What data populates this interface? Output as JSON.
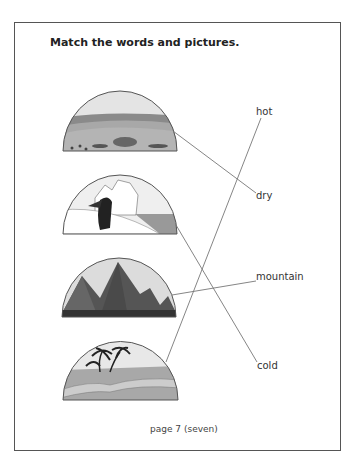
{
  "title": "Match the words and pictures.",
  "pictures": [
    {
      "name": "savanna-plain"
    },
    {
      "name": "penguin-iceberg"
    },
    {
      "name": "mountains"
    },
    {
      "name": "oasis-palm-trees"
    }
  ],
  "words": [
    {
      "label": "hot"
    },
    {
      "label": "dry"
    },
    {
      "label": "mountain"
    },
    {
      "label": "cold"
    }
  ],
  "footer": "page 7 (seven)"
}
